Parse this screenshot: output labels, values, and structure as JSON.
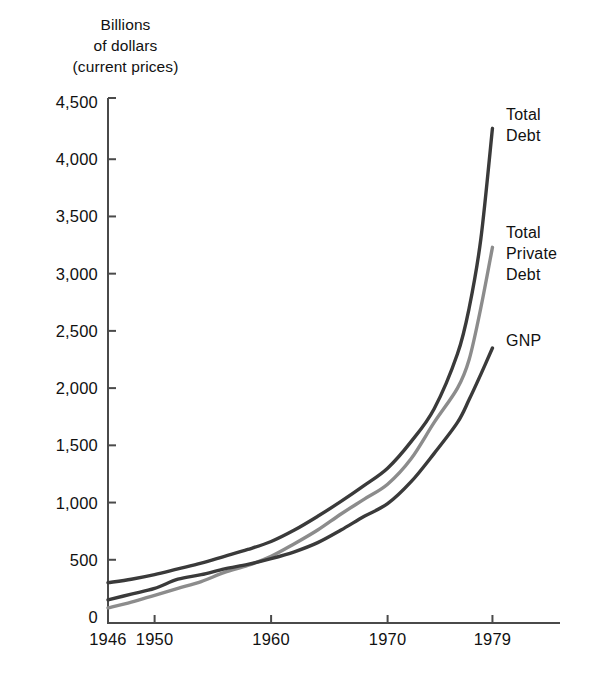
{
  "chart_data": {
    "type": "line",
    "title": "Billions of dollars (current prices)",
    "title_lines": [
      "Billions",
      "of dollars",
      "(current prices)"
    ],
    "xlabel": "",
    "ylabel": "Billions of dollars (current prices)",
    "xlim": [
      1946,
      1982
    ],
    "ylim": [
      0,
      4500
    ],
    "grid": false,
    "legend_position": "right-inline",
    "ytick_labels": [
      "4,500",
      "4,000",
      "3,500",
      "3,000",
      "2,500",
      "2,000",
      "1,500",
      "1,000",
      "500",
      "0"
    ],
    "ytick_values": [
      4500,
      4000,
      3500,
      3000,
      2500,
      2000,
      1500,
      1000,
      500,
      0
    ],
    "xtick_labels": [
      "1946",
      "1950",
      "1960",
      "1970",
      "1979"
    ],
    "xtick_values": [
      1946,
      1950,
      1960,
      1970,
      1979
    ],
    "series": [
      {
        "name": "Total Debt",
        "label_lines": [
          "Total",
          "Debt"
        ],
        "color": "#3a3a3a",
        "width": 3.4,
        "x": [
          1946,
          1948,
          1950,
          1952,
          1954,
          1956,
          1958,
          1960,
          1962,
          1964,
          1966,
          1968,
          1970,
          1972,
          1974,
          1976,
          1977,
          1978,
          1979
        ],
        "values": [
          300,
          330,
          370,
          420,
          470,
          530,
          590,
          660,
          760,
          880,
          1010,
          1150,
          1300,
          1530,
          1820,
          2300,
          2700,
          3300,
          4270
        ]
      },
      {
        "name": "Total Private Debt",
        "label_lines": [
          "Total",
          "Private",
          "Debt"
        ],
        "color": "#8c8c8c",
        "width": 3.4,
        "x": [
          1946,
          1948,
          1950,
          1952,
          1954,
          1956,
          1958,
          1960,
          1962,
          1964,
          1966,
          1968,
          1970,
          1972,
          1974,
          1976,
          1977,
          1978,
          1979
        ],
        "values": [
          80,
          130,
          190,
          250,
          310,
          390,
          450,
          530,
          640,
          760,
          900,
          1030,
          1160,
          1380,
          1700,
          2000,
          2250,
          2700,
          3230
        ]
      },
      {
        "name": "GNP",
        "label_lines": [
          "GNP"
        ],
        "color": "#3a3a3a",
        "width": 3.4,
        "x": [
          1946,
          1948,
          1950,
          1952,
          1954,
          1956,
          1958,
          1960,
          1962,
          1964,
          1966,
          1968,
          1970,
          1972,
          1974,
          1976,
          1977,
          1978,
          1979
        ],
        "values": [
          150,
          200,
          250,
          330,
          370,
          420,
          460,
          510,
          570,
          650,
          760,
          880,
          990,
          1180,
          1430,
          1700,
          1900,
          2120,
          2350
        ]
      }
    ]
  },
  "geometry": {
    "plot_left": 108,
    "plot_right": 560,
    "plot_top": 98,
    "plot_bottom": 623,
    "y_value_top": 4500,
    "y_pixel_top": 102,
    "y_value_bottom": 0,
    "y_pixel_bottom": 617,
    "x_value_left": 1946,
    "x_pixel_left": 108,
    "px_per_year": 11.65,
    "axis_color": "#4a4a4a",
    "tick_len": 8
  },
  "series_label_positions": [
    {
      "x": 506,
      "y": 104
    },
    {
      "x": 506,
      "y": 222
    },
    {
      "x": 506,
      "y": 330
    }
  ]
}
